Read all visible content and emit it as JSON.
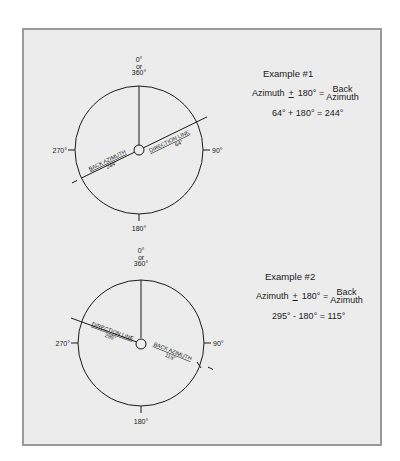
{
  "figure": {
    "frame_background": "#ececec",
    "frame_border": "#9a9a9a",
    "line_color": "#1a1a1a"
  },
  "compass_labels": {
    "north_0": "0°",
    "north_or": "or",
    "north_360": "360°",
    "east": "90°",
    "south": "180°",
    "west": "270°"
  },
  "examples": [
    {
      "title": "Example #1",
      "formula_left": "Azimuth",
      "formula_pm": "+",
      "formula_180": "180° =",
      "formula_right_top": "Back",
      "formula_right_bottom": "Azimuth",
      "calculation": "64° + 180° = 244°",
      "direction_line_label": "DIRECTION LINE",
      "direction_line_value": "64°",
      "back_azimuth_label": "BACK AZIMUTH",
      "back_azimuth_value": "244°",
      "direction_angle_deg": 64,
      "back_azimuth_angle_deg": 244
    },
    {
      "title": "Example #2",
      "formula_left": "Azimuth",
      "formula_pm": "+",
      "formula_180": "180° =",
      "formula_right_top": "Back",
      "formula_right_bottom": "Azimuth",
      "calculation": "295° - 180° = 115°",
      "direction_line_label": "DIRECTION LINE",
      "direction_line_value": "295°",
      "back_azimuth_label": "BACK AZIMUTH",
      "back_azimuth_value": "115°",
      "direction_angle_deg": 295,
      "back_azimuth_angle_deg": 115
    }
  ]
}
